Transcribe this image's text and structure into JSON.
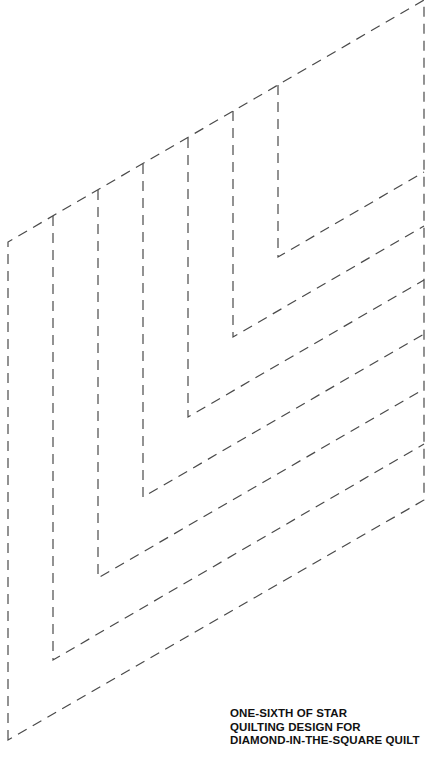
{
  "title": "One-sixth of star quilting design for Diamond-in-the-Square quilt",
  "caption": {
    "lines": [
      "ONE-SIXTH OF STAR",
      "QUILTING DESIGN FOR",
      "DIAMOND-IN-THE-SQUARE QUILT"
    ]
  },
  "diagram": {
    "shape": "parallelogram (60° diamond section)",
    "line_style": "dashed",
    "line_color": "#4a4a4a",
    "outline": {
      "top_left": [
        8,
        242
      ],
      "top_right": [
        424,
        0
      ],
      "bottom_right": [
        424,
        500
      ],
      "bottom_left": [
        8,
        740
      ]
    },
    "nested_chevrons": [
      {
        "x": 53,
        "top_y": 216,
        "corner_y": 660,
        "right_y": 419
      },
      {
        "x": 98,
        "top_y": 190,
        "corner_y": 578,
        "right_y": 389
      },
      {
        "x": 143,
        "top_y": 164,
        "corner_y": 497,
        "right_y": 334
      },
      {
        "x": 188,
        "top_y": 138,
        "corner_y": 417,
        "right_y": 280
      },
      {
        "x": 233,
        "top_y": 111,
        "corner_y": 337,
        "right_y": 226
      },
      {
        "x": 278,
        "top_y": 85,
        "corner_y": 257,
        "right_y": 172
      }
    ],
    "chevron_count": 6
  }
}
